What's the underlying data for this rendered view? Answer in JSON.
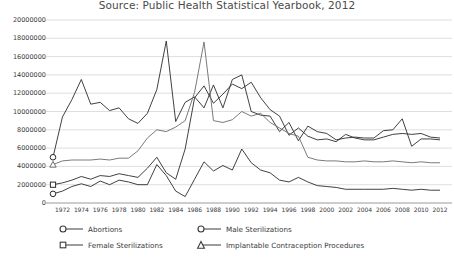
{
  "chart_data": {
    "type": "line",
    "title": "Source: Public Health Statistical Yearbook, 2012",
    "xlabel": "",
    "ylabel": "",
    "grid": true,
    "legend_position": "bottom",
    "ylim": [
      0,
      20000000
    ],
    "yticks": [
      "0",
      "2000000",
      "4000000",
      "6000000",
      "8000000",
      "10000000",
      "12000000",
      "14000000",
      "16000000",
      "18000000",
      "20000000"
    ],
    "ytick_values": [
      0,
      2000000,
      4000000,
      6000000,
      8000000,
      10000000,
      12000000,
      14000000,
      16000000,
      18000000,
      20000000
    ],
    "xlim": [
      1971,
      2012
    ],
    "xticks": [
      "1972",
      "1974",
      "1976",
      "1978",
      "1980",
      "1982",
      "1984",
      "1986",
      "1988",
      "1990",
      "1992",
      "1994",
      "1996",
      "1998",
      "2000",
      "2002",
      "2004",
      "2006",
      "2008",
      "2010",
      "2012"
    ],
    "x": [
      1971,
      1972,
      1973,
      1974,
      1975,
      1976,
      1977,
      1978,
      1979,
      1980,
      1981,
      1982,
      1983,
      1984,
      1985,
      1986,
      1987,
      1988,
      1989,
      1990,
      1991,
      1992,
      1993,
      1994,
      1995,
      1996,
      1997,
      1998,
      1999,
      2000,
      2001,
      2002,
      2003,
      2004,
      2005,
      2006,
      2007,
      2008,
      2009,
      2010,
      2011,
      2012
    ],
    "series": [
      {
        "name": "Abortions",
        "marker": "circle",
        "color": "#2b2b2b",
        "values": [
          5000000,
          9400000,
          11300000,
          13500000,
          10800000,
          11000000,
          10100000,
          10400000,
          9200000,
          8700000,
          9800000,
          12400000,
          17700000,
          8900000,
          11000000,
          11600000,
          10400000,
          12900000,
          10400000,
          13500000,
          14000000,
          10000000,
          9600000,
          9500000,
          7800000,
          8800000,
          6800000,
          8400000,
          7800000,
          7600000,
          6900000,
          7100000,
          7200000,
          7100000,
          7100000,
          7900000,
          8000000,
          9200000,
          6200000,
          7000000,
          7000000,
          6900000
        ]
      },
      {
        "name": "Female Sterilizations",
        "marker": "square",
        "color": "#2b2b2b",
        "values": [
          2000000,
          2200000,
          2500000,
          2900000,
          2600000,
          3000000,
          2900000,
          3200000,
          3000000,
          2800000,
          3800000,
          5000000,
          3300000,
          2600000,
          5900000,
          11500000,
          12800000,
          10900000,
          11900000,
          13000000,
          12500000,
          13200000,
          11500000,
          10200000,
          9500000,
          7400000,
          8200000,
          7300000,
          6900000,
          7000000,
          6700000,
          7500000,
          7100000,
          6900000,
          6900000,
          7200000,
          7500000,
          7600000,
          7500000,
          7600000,
          7200000,
          7100000
        ]
      },
      {
        "name": "Male Sterilizations",
        "marker": "circle",
        "color": "#2b2b2b",
        "values": [
          1000000,
          1300000,
          1800000,
          2100000,
          1800000,
          2400000,
          2000000,
          2500000,
          2300000,
          2000000,
          2000000,
          4200000,
          3000000,
          1300000,
          700000,
          2600000,
          4500000,
          3500000,
          4100000,
          3600000,
          5900000,
          4400000,
          3600000,
          3300000,
          2500000,
          2300000,
          2800000,
          2300000,
          1900000,
          1800000,
          1700000,
          1500000,
          1500000,
          1500000,
          1500000,
          1500000,
          1600000,
          1500000,
          1400000,
          1500000,
          1400000,
          1400000
        ]
      },
      {
        "name": "Implantable Contraception Procedures",
        "marker": "triangle",
        "color": "#6b6b6b",
        "values": [
          4200000,
          4600000,
          4700000,
          4700000,
          4700000,
          4800000,
          4700000,
          4900000,
          4900000,
          5700000,
          7100000,
          8000000,
          7800000,
          8300000,
          9000000,
          12100000,
          17600000,
          9000000,
          8800000,
          9100000,
          10000000,
          9500000,
          9800000,
          8800000,
          8200000,
          7600000,
          7300000,
          5000000,
          4700000,
          4600000,
          4600000,
          4500000,
          4500000,
          4600000,
          4500000,
          4500000,
          4600000,
          4500000,
          4400000,
          4500000,
          4400000,
          4400000
        ]
      }
    ]
  },
  "legend": {
    "items": [
      {
        "label": "Abortions",
        "marker": "circle"
      },
      {
        "label": "Male Sterilizations",
        "marker": "circle"
      },
      {
        "label": "Female Sterilizations",
        "marker": "square"
      },
      {
        "label": "Implantable Contraception Procedures",
        "marker": "triangle"
      }
    ]
  }
}
